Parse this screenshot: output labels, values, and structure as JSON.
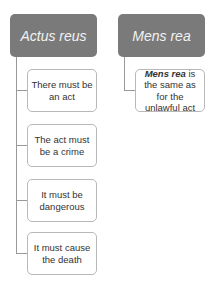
{
  "columns": [
    {
      "header": "Actus reus",
      "items": [
        "There must be an act",
        "The act must be a crime",
        "It must be dangerous",
        "It must cause the death"
      ]
    },
    {
      "header": "Mens rea",
      "items": [
        {
          "bold_italic": "Mens rea",
          "rest": " is the same as for the unlawful act"
        }
      ]
    }
  ],
  "colors": {
    "header_bg": "#7a7a7a",
    "header_text": "#f2f2f2",
    "connector": "#999999",
    "box_border": "#b8b8b8"
  }
}
